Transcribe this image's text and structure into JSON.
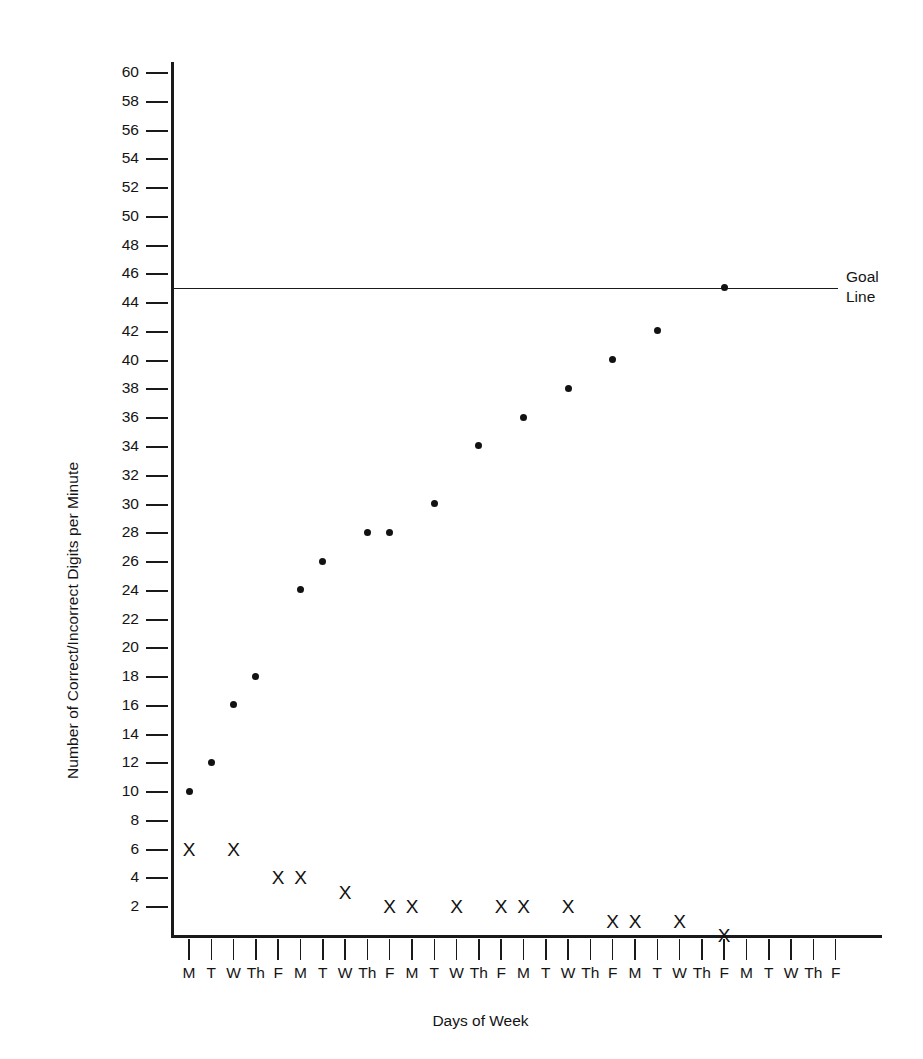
{
  "chart_data": {
    "type": "scatter",
    "title": "",
    "xlabel": "Days of Week",
    "ylabel": "Number of Correct/Incorrect Digits per Minute",
    "ylim": [
      0,
      60
    ],
    "ytick_labels": [
      "60",
      "58",
      "56",
      "54",
      "52",
      "50",
      "48",
      "46",
      "44",
      "42",
      "40",
      "38",
      "36",
      "34",
      "32",
      "30",
      "28",
      "26",
      "24",
      "22",
      "20",
      "18",
      "16",
      "14",
      "12",
      "10",
      "8",
      "6",
      "4",
      "2"
    ],
    "ytick_values": [
      60,
      58,
      56,
      54,
      52,
      50,
      48,
      46,
      44,
      42,
      40,
      38,
      36,
      34,
      32,
      30,
      28,
      26,
      24,
      22,
      20,
      18,
      16,
      14,
      12,
      10,
      8,
      6,
      4,
      2
    ],
    "grid": false,
    "legend_position": "none",
    "x_tick_labels": [
      "M",
      "T",
      "W",
      "Th",
      "F",
      "M",
      "T",
      "W",
      "Th",
      "F",
      "M",
      "T",
      "W",
      "Th",
      "F",
      "M",
      "T",
      "W",
      "Th",
      "F",
      "M",
      "T",
      "W",
      "Th",
      "F",
      "M",
      "T",
      "W",
      "Th",
      "F"
    ],
    "x_count": 30,
    "annotations": [
      {
        "name": "goal-line",
        "label": "Goal\nLine",
        "label_line1": "Goal",
        "label_line2": "Line",
        "value": 45,
        "style": "horizontal-line"
      }
    ],
    "series": [
      {
        "name": "Correct Digits per Minute",
        "marker": "filled-circle",
        "points": [
          {
            "x": 1,
            "day": "M",
            "y": 10
          },
          {
            "x": 2,
            "day": "T",
            "y": 12
          },
          {
            "x": 3,
            "day": "W",
            "y": 16
          },
          {
            "x": 4,
            "day": "Th",
            "y": 18
          },
          {
            "x": 6,
            "day": "M",
            "y": 24
          },
          {
            "x": 7,
            "day": "T",
            "y": 26
          },
          {
            "x": 9,
            "day": "Th",
            "y": 28
          },
          {
            "x": 10,
            "day": "F",
            "y": 28
          },
          {
            "x": 12,
            "day": "T",
            "y": 30
          },
          {
            "x": 14,
            "day": "Th",
            "y": 34
          },
          {
            "x": 16,
            "day": "M",
            "y": 36
          },
          {
            "x": 18,
            "day": "W",
            "y": 38
          },
          {
            "x": 20,
            "day": "F",
            "y": 40
          },
          {
            "x": 22,
            "day": "T",
            "y": 42
          },
          {
            "x": 25,
            "day": "F",
            "y": 45
          }
        ]
      },
      {
        "name": "Incorrect Digits per Minute",
        "marker": "x",
        "points": [
          {
            "x": 1,
            "day": "M",
            "y": 6
          },
          {
            "x": 3,
            "day": "W",
            "y": 6
          },
          {
            "x": 5,
            "day": "F",
            "y": 4
          },
          {
            "x": 6,
            "day": "M",
            "y": 4
          },
          {
            "x": 8,
            "day": "W",
            "y": 3
          },
          {
            "x": 10,
            "day": "F",
            "y": 2
          },
          {
            "x": 11,
            "day": "M",
            "y": 2
          },
          {
            "x": 13,
            "day": "W",
            "y": 2
          },
          {
            "x": 15,
            "day": "F",
            "y": 2
          },
          {
            "x": 16,
            "day": "M",
            "y": 2
          },
          {
            "x": 18,
            "day": "W",
            "y": 2
          },
          {
            "x": 20,
            "day": "F",
            "y": 1
          },
          {
            "x": 21,
            "day": "M",
            "y": 1
          },
          {
            "x": 23,
            "day": "W",
            "y": 1
          },
          {
            "x": 25,
            "day": "F",
            "y": 0
          }
        ]
      }
    ]
  }
}
